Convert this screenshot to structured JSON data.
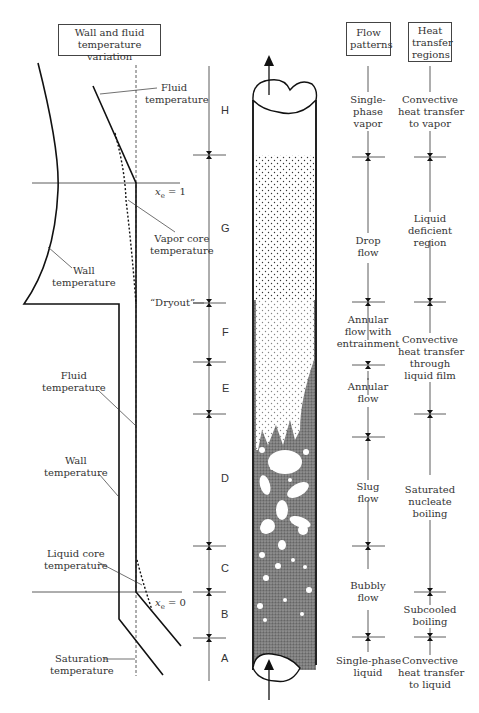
{
  "headers": {
    "wall_fluid": "Wall and fluid temperature variation",
    "wall_fluid_l1": "Wall and fluid",
    "wall_fluid_l2": "temperature variation",
    "flow_l1": "Flow",
    "flow_l2": "patterns",
    "heat_l1": "Heat",
    "heat_l2": "transfer",
    "heat_l3": "regions"
  },
  "temperature_labels": {
    "fluid_top_l1": "Fluid",
    "fluid_top_l2": "temperature",
    "vapor_core_l1": "Vapor core",
    "vapor_core_l2": "temperature",
    "wall_top_l1": "Wall",
    "wall_top_l2": "temperature",
    "fluid_mid_l1": "Fluid",
    "fluid_mid_l2": "temperature",
    "wall_mid_l1": "Wall",
    "wall_mid_l2": "temperature",
    "liquid_core_l1": "Liquid core",
    "liquid_core_l2": "temperature",
    "saturation_l1": "Saturation",
    "saturation_l2": "temperature",
    "xe1": "xe = 1",
    "xe0": "xe = 0",
    "dryout": "“Dryout”"
  },
  "regions": [
    "H",
    "G",
    "F",
    "E",
    "D",
    "C",
    "B",
    "A"
  ],
  "flow_patterns": [
    {
      "region": "H",
      "lines": [
        "Single-",
        "phase",
        "vapor"
      ]
    },
    {
      "region": "G",
      "lines": [
        "Drop",
        "flow"
      ]
    },
    {
      "region": "F",
      "lines": [
        "Annular",
        "flow with",
        "entrainment"
      ]
    },
    {
      "region": "E",
      "lines": [
        "Annular",
        "flow"
      ]
    },
    {
      "region": "D",
      "lines": [
        "Slug",
        "flow"
      ]
    },
    {
      "region": "C",
      "lines": [
        "Bubbly",
        "flow"
      ]
    },
    {
      "region": "A",
      "lines": [
        "Single-phase",
        "liquid"
      ]
    }
  ],
  "heat_transfer_regions": [
    {
      "lines": [
        "Convective",
        "heat transfer",
        "to vapor"
      ]
    },
    {
      "lines": [
        "Liquid",
        "deficient",
        "region"
      ]
    },
    {
      "lines": [
        "Convective",
        "heat transfer",
        "through",
        "liquid film"
      ]
    },
    {
      "lines": [
        "Saturated",
        "nucleate",
        "boiling"
      ]
    },
    {
      "lines": [
        "Subcooled",
        "boiling"
      ]
    },
    {
      "lines": [
        "Convective",
        "heat transfer",
        "to liquid"
      ]
    }
  ]
}
